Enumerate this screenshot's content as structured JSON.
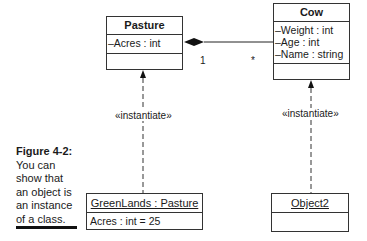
{
  "diagram": {
    "classes": [
      {
        "name": "Pasture",
        "attributes": [
          "–Acres : int"
        ]
      },
      {
        "name": "Cow",
        "attributes": [
          "–Weight : int",
          "–Age : int",
          "–Name : string"
        ]
      }
    ],
    "objects": [
      {
        "name": "GreenLands : Pasture",
        "attributes": [
          "Acres : int = 25"
        ]
      },
      {
        "name": "Object2",
        "attributes": []
      }
    ],
    "association": {
      "type": "composition",
      "from": "Pasture",
      "to": "Cow",
      "multiplicity_from": "1",
      "multiplicity_to": "*"
    },
    "dependencies": [
      {
        "from": "GreenLands : Pasture",
        "to": "Pasture",
        "stereotype": "«instantiate»"
      },
      {
        "from": "Object2",
        "to": "Cow",
        "stereotype": "«instantiate»"
      }
    ]
  },
  "caption": {
    "figure": "Figure 4-2:",
    "text": "You can show that an object is an instance of a class."
  }
}
